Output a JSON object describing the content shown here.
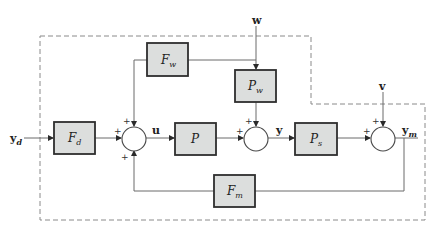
{
  "diagram": {
    "type": "block-diagram",
    "boundary": "dashed outline enclosing controller/plant",
    "blocks": [
      {
        "id": "Fd",
        "label": "F",
        "sub": "d"
      },
      {
        "id": "Fw",
        "label": "F",
        "sub": "w"
      },
      {
        "id": "P",
        "label": "P",
        "sub": ""
      },
      {
        "id": "Pw",
        "label": "P",
        "sub": "w"
      },
      {
        "id": "Ps",
        "label": "P",
        "sub": "s"
      },
      {
        "id": "Fm",
        "label": "F",
        "sub": "m"
      }
    ],
    "signals": {
      "yd": {
        "label": "y",
        "sub": "d"
      },
      "u": {
        "label": "u",
        "sub": ""
      },
      "y": {
        "label": "y",
        "sub": ""
      },
      "ym": {
        "label": "y",
        "sub": "m"
      },
      "w": {
        "label": "w",
        "sub": ""
      },
      "v": {
        "label": "v",
        "sub": ""
      }
    },
    "sums": [
      {
        "id": "sum1",
        "signs": [
          "+",
          "+",
          "+"
        ]
      },
      {
        "id": "sum2",
        "signs": [
          "+",
          "+"
        ]
      },
      {
        "id": "sum3",
        "signs": [
          "+",
          "+"
        ]
      }
    ],
    "plus": "+",
    "colors": {
      "block_fill": "#dcdedd",
      "block_border": "#2e2e2e",
      "wire": "#6a6a6a",
      "dash": "#8a8a8a"
    }
  }
}
